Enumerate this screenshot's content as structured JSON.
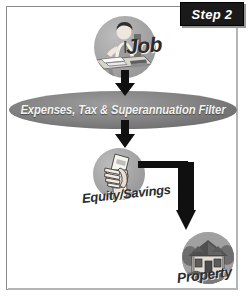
{
  "diagram": {
    "title": "Step 2",
    "badge": {
      "label": "Step 2",
      "background": "#1a1a1a",
      "text_color": "#ffffff"
    },
    "frame": {
      "border_color": "#8a8a8a",
      "shadow_color": "#b5b5b5",
      "background": "#ffffff"
    },
    "nodes": [
      {
        "id": "job",
        "label": "Job",
        "icon": "person-at-desk-icon",
        "shape": "circle",
        "fill": "#a3a3a3"
      },
      {
        "id": "filter",
        "label": "Expenses, Tax & Superannuation Filter",
        "icon": "filter-ellipse-icon",
        "shape": "ellipse",
        "fill": "#7d7d7d",
        "text_color": "#f2f2f2"
      },
      {
        "id": "equity",
        "label": "Equity/Savings",
        "icon": "hand-holding-money-icon",
        "shape": "circle",
        "fill": "#a3a3a3"
      },
      {
        "id": "property",
        "label": "Property",
        "icon": "house-icon",
        "shape": "circle",
        "fill": "#a3a3a3"
      }
    ],
    "connectors": [
      {
        "id": "job-to-filter",
        "from": "job",
        "to": "filter",
        "style": "down-arrow",
        "color": "#101010"
      },
      {
        "id": "filter-to-equity",
        "from": "filter",
        "to": "equity",
        "style": "down-arrow",
        "color": "#101010"
      },
      {
        "id": "equity-to-property",
        "from": "equity",
        "to": "property",
        "style": "elbow-arrow-right-down",
        "color": "#101010"
      }
    ]
  }
}
